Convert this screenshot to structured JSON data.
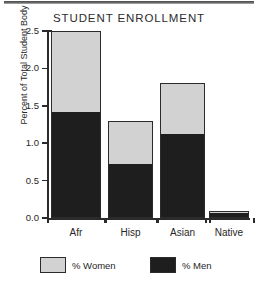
{
  "chart_data": {
    "type": "bar",
    "subtype": "stacked-bar",
    "title": "STUDENT ENROLLMENT",
    "xlabel": "",
    "ylabel": "Percent of Total Student Body",
    "categories": [
      "Afr",
      "Hisp",
      "Asian",
      "Native"
    ],
    "series": [
      {
        "name": "% Men",
        "color": "#1e1e1e",
        "values": [
          1.42,
          0.72,
          1.12,
          0.07
        ]
      },
      {
        "name": "% Women",
        "color": "#d2d2d2",
        "values": [
          1.08,
          0.58,
          0.68,
          0.03
        ]
      }
    ],
    "totals": [
      2.5,
      1.3,
      1.8,
      0.1
    ],
    "ylim": [
      0.0,
      2.5
    ],
    "ytick_labels": [
      "2.5",
      "2.0",
      "1.5",
      "1.0",
      "0.5",
      "0.0"
    ],
    "ytick_values": [
      2.5,
      2.0,
      1.5,
      1.0,
      0.5,
      0.0
    ],
    "grid": false,
    "legend_position": "bottom",
    "legend": [
      {
        "label": "% Women",
        "color": "#d2d2d2"
      },
      {
        "label": "% Men",
        "color": "#1e1e1e"
      }
    ]
  }
}
